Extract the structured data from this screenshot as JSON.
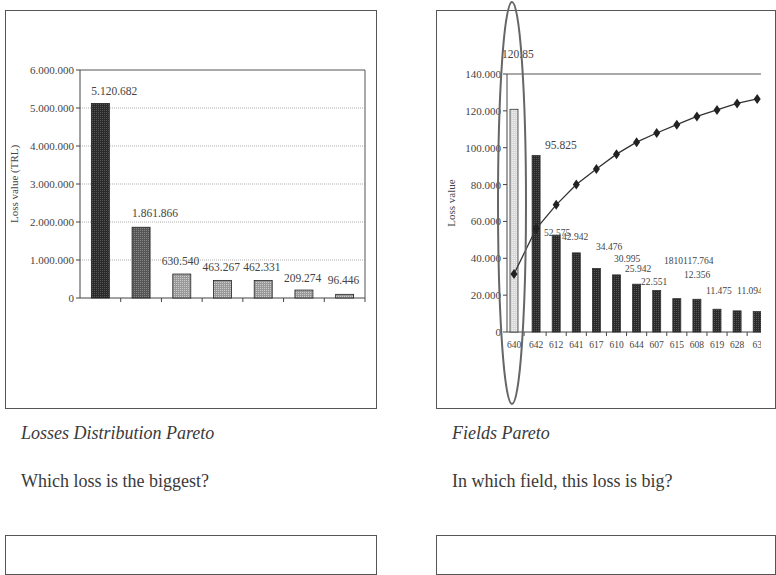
{
  "panels": [
    {
      "caption": "Losses Distribution Pareto",
      "question": "Which loss is the biggest?"
    },
    {
      "caption": "Fields Pareto",
      "question": "In which field, this loss is big?"
    }
  ],
  "chart_data": [
    {
      "type": "bar",
      "title": "Losses Distribution Pareto",
      "xlabel": "",
      "ylabel": "Loss value (TRL)",
      "ylim": [
        0,
        6000000
      ],
      "yticks": [
        "0",
        "1.000.000",
        "2.000.000",
        "3.000.000",
        "4.000.000",
        "5.000.000",
        "6.000.000"
      ],
      "grid": true,
      "categories": [
        "1",
        "2",
        "3",
        "4",
        "5",
        "6",
        "7"
      ],
      "values": [
        5120682,
        1861866,
        630540,
        463267,
        462331,
        209274,
        96446
      ],
      "data_labels": [
        "5.120.682",
        "1.861.866",
        "630.540",
        "463.267",
        "462.331",
        "209.274",
        "96.446"
      ]
    },
    {
      "type": "bar",
      "title": "Fields Pareto",
      "xlabel": "",
      "ylabel": "Loss value",
      "ylim": [
        0,
        140000
      ],
      "yticks": [
        "0",
        "20.000",
        "40.000",
        "60.000",
        "80.000",
        "100.000",
        "120.000",
        "140.000"
      ],
      "grid": false,
      "categories": [
        "640",
        "642",
        "612",
        "641",
        "617",
        "610",
        "644",
        "607",
        "615",
        "608",
        "619",
        "628",
        "63"
      ],
      "series": [
        {
          "name": "Loss value",
          "values": [
            120850,
            95825,
            52575,
            42942,
            34476,
            30995,
            25942,
            22551,
            18101,
            17764,
            12356,
            11475,
            11094
          ]
        },
        {
          "name": "Cumulative",
          "values": [
            31500,
            56000,
            69000,
            80000,
            88500,
            96500,
            103000,
            108000,
            112500,
            117000,
            120500,
            124000,
            126500
          ]
        }
      ],
      "data_labels": [
        "120.85",
        "95.825",
        "52.575",
        "42.942",
        "34.476",
        "30.995",
        "25.942",
        "22.551",
        "1810117.764",
        "12.356",
        "11.475",
        "11.094"
      ],
      "annotation": "ellipse highlighting field 640"
    }
  ]
}
